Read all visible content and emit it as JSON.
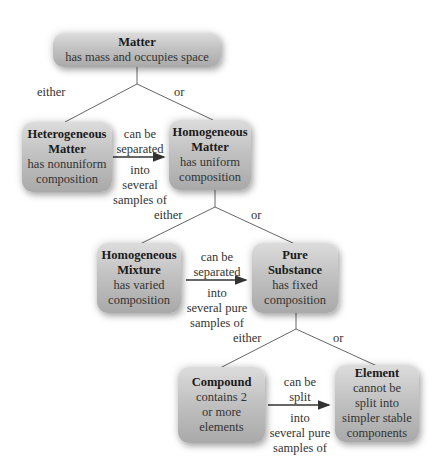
{
  "nodes": {
    "matter": {
      "title": "Matter",
      "desc": [
        "has mass and occupies space"
      ]
    },
    "heterogeneous_matter": {
      "title": [
        "Heterogeneous",
        "Matter"
      ],
      "desc": [
        "has nonuniform",
        "composition"
      ]
    },
    "homogeneous_matter": {
      "title": [
        "Homogeneous",
        "Matter"
      ],
      "desc": [
        "has uniform",
        "composition"
      ]
    },
    "homogeneous_mixture": {
      "title": [
        "Homogeneous",
        "Mixture"
      ],
      "desc": [
        "has varied",
        "composition"
      ]
    },
    "pure_substance": {
      "title": [
        "Pure",
        "Substance"
      ],
      "desc": [
        "has fixed",
        "composition"
      ]
    },
    "compound": {
      "title": [
        "Compound"
      ],
      "desc": [
        "contains 2",
        "or more",
        "elements"
      ]
    },
    "element": {
      "title": [
        "Element"
      ],
      "desc": [
        "cannot be",
        "split into",
        "simpler stable",
        "components"
      ]
    }
  },
  "branches": {
    "either": "either",
    "or": "or"
  },
  "arrows": {
    "a1": {
      "above": [
        "can be",
        "separated"
      ],
      "below": [
        "into",
        "several",
        "samples of"
      ]
    },
    "a2": {
      "above": [
        "can be",
        "separated"
      ],
      "below": [
        "into",
        "several pure",
        "samples of"
      ]
    },
    "a3": {
      "above": [
        "can be",
        "split"
      ],
      "below": [
        "into",
        "several pure",
        "samples of"
      ]
    }
  },
  "colors": {
    "box_top": "#dcdcdc",
    "box_bottom": "#a9a9a9",
    "line": "#555555"
  }
}
